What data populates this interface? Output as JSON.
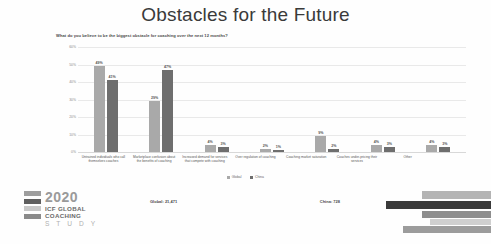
{
  "slide": {
    "title": "Obstacles for the Future",
    "subtitle": "What do you believe to be the biggest obstacle for coaching over the next 12 months?",
    "counts": {
      "global": "Global: 21,471",
      "china": "China: 728"
    }
  },
  "logo": {
    "year": "2020",
    "line2": "ICF GLOBAL",
    "line3": "COACHING",
    "line4": "S T U D Y",
    "bar_colors": [
      "#9e9e9e",
      "#5f5f5f",
      "#c8c8c8",
      "#8a8a8a"
    ]
  },
  "colors": {
    "global": "#a9a9a9",
    "china": "#6e6e6e",
    "grid": "#e9e9e9"
  },
  "chart_data": {
    "type": "bar",
    "title": "Obstacles for the Future",
    "subtitle": "What do you believe to be the biggest obstacle for coaching over the next 12 months?",
    "categories": [
      "Untrained individuals who call themselves coaches",
      "Marketplace confusion about the benefits of coaching",
      "Increased demand for services that compete with coaching",
      "Over regulation of coaching",
      "Coaching market saturation",
      "Coaches under-pricing their services",
      "Other"
    ],
    "series": [
      {
        "name": "Global",
        "color": "#a9a9a9",
        "values": [
          49,
          29,
          4,
          2,
          9,
          4,
          4
        ],
        "labels": [
          "49%",
          "29%",
          "4%",
          "2%",
          "9%",
          "4%",
          "4%"
        ]
      },
      {
        "name": "China",
        "color": "#6e6e6e",
        "values": [
          41,
          47,
          3,
          1,
          2,
          3,
          3
        ],
        "labels": [
          "41%",
          "47%",
          "3%",
          "1%",
          "2%",
          "3%",
          "3%"
        ]
      }
    ],
    "xlabel": "",
    "ylabel": "",
    "ylim": [
      0,
      60
    ],
    "yticks": [
      "0%",
      "10%",
      "20%",
      "30%",
      "40%",
      "50%",
      "60%"
    ],
    "ytick_values": [
      0,
      10,
      20,
      30,
      40,
      50,
      60
    ],
    "grid": true,
    "legend_position": "bottom",
    "legend": [
      "Global",
      "China"
    ]
  }
}
